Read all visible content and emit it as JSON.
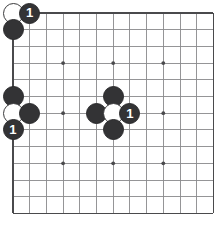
{
  "diagram": {
    "board": {
      "columns": 13,
      "rows": 13,
      "origin_x": 13,
      "origin_y": 13,
      "cell": 16.7,
      "line_color": "#8a8a8c",
      "edge_color": "#4a4a4c",
      "background": "#ffffff",
      "star_point_color": "#4a4a4c",
      "star_points": [
        {
          "col": 3,
          "row": 3
        },
        {
          "col": 6,
          "row": 3
        },
        {
          "col": 9,
          "row": 3
        },
        {
          "col": 3,
          "row": 6
        },
        {
          "col": 6,
          "row": 6
        },
        {
          "col": 9,
          "row": 6
        },
        {
          "col": 3,
          "row": 9
        },
        {
          "col": 6,
          "row": 9
        },
        {
          "col": 9,
          "row": 9
        }
      ]
    },
    "stone_colors": {
      "black": "#333335",
      "white": "#ffffff",
      "black_outline": "#2a2a2c",
      "white_outline": "#3a3a3c",
      "label_on_black": "#ffffff",
      "label_on_white": "#2a2a2c"
    },
    "stone_radius": 10.5,
    "stones": [
      {
        "id": "w-corner-top-left",
        "color": "white",
        "col": 0,
        "row": 0,
        "label": ""
      },
      {
        "id": "b-move-1-top",
        "color": "black",
        "col": 1,
        "row": 0,
        "label": "1"
      },
      {
        "id": "b-top-left-below",
        "color": "black",
        "col": 0,
        "row": 1,
        "label": ""
      },
      {
        "id": "b-left-upper",
        "color": "black",
        "col": 0,
        "row": 5,
        "label": ""
      },
      {
        "id": "w-left-edge",
        "color": "white",
        "col": 0,
        "row": 6,
        "label": ""
      },
      {
        "id": "b-left-right-of-white",
        "color": "black",
        "col": 1,
        "row": 6,
        "label": ""
      },
      {
        "id": "b-move-1-left",
        "color": "black",
        "col": 0,
        "row": 7,
        "label": "1"
      },
      {
        "id": "b-center-top",
        "color": "black",
        "col": 6,
        "row": 5,
        "label": ""
      },
      {
        "id": "b-center-left",
        "color": "black",
        "col": 5,
        "row": 6,
        "label": ""
      },
      {
        "id": "w-center",
        "color": "white",
        "col": 6,
        "row": 6,
        "label": ""
      },
      {
        "id": "b-move-1-center",
        "color": "black",
        "col": 7,
        "row": 6,
        "label": "1"
      },
      {
        "id": "b-center-bottom",
        "color": "black",
        "col": 6,
        "row": 7,
        "label": ""
      }
    ]
  }
}
